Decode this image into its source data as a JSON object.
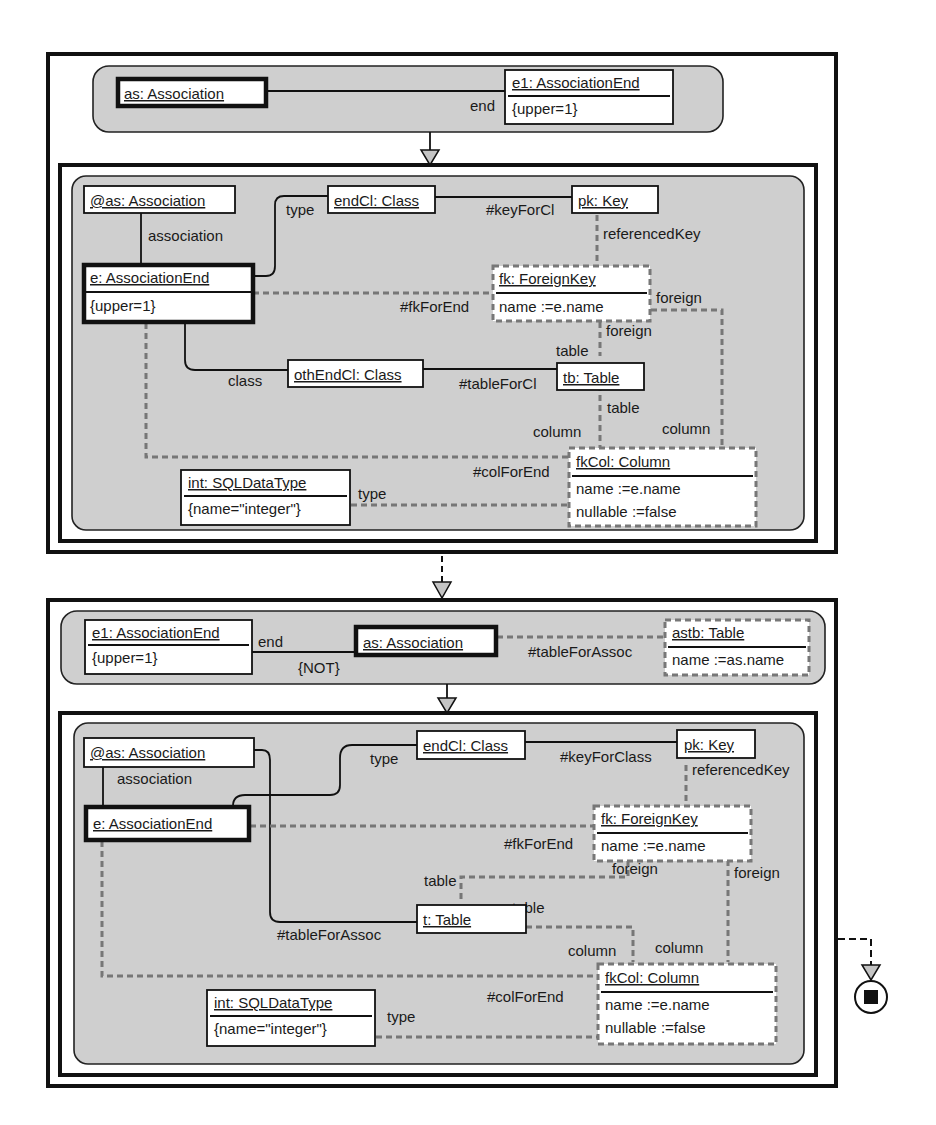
{
  "rule1": {
    "lhs": {
      "as_assoc": "as: Association",
      "e1_end": "e1: AssociationEnd",
      "e1_attr": "{upper=1}",
      "edge_end": "end"
    },
    "rhs": {
      "at_as": "@as: Association",
      "association": "association",
      "e_end": "e: AssociationEnd",
      "e_attr": "{upper=1}",
      "type": "type",
      "endCl": "endCl: Class",
      "keyForCl": "#keyForCl",
      "pk": "pk: Key",
      "referencedKey": "referencedKey",
      "fk": "fk: ForeignKey",
      "fk_attr": "name :=e.name",
      "fkForEnd": "#fkForEnd",
      "foreign1": "foreign",
      "foreign2": "foreign",
      "table1": "table",
      "class": "class",
      "othEndCl": "othEndCl: Class",
      "tableForCl": "#tableForCl",
      "tb": "tb: Table",
      "table2": "table",
      "column1": "column",
      "column2": "column",
      "colForEnd": "#colForEnd",
      "fkCol": "fkCol: Column",
      "fkCol_attr1": "name :=e.name",
      "fkCol_attr2": "nullable :=false",
      "int": "int: SQLDataType",
      "int_attr": "{name=\"integer\"}",
      "type2": "type"
    }
  },
  "rule2": {
    "lhs": {
      "e1_end": "e1: AssociationEnd",
      "e1_attr": "{upper=1}",
      "edge_end": "end",
      "not": "{NOT}",
      "as_assoc": "as: Association",
      "tableForAssoc": "#tableForAssoc",
      "astb": "astb: Table",
      "astb_attr": "name :=as.name"
    },
    "rhs": {
      "at_as": "@as: Association",
      "association": "association",
      "e_end": "e: AssociationEnd",
      "type": "type",
      "endCl": "endCl: Class",
      "keyForClass": "#keyForClass",
      "pk": "pk: Key",
      "referencedKey": "referencedKey",
      "fk": "fk: ForeignKey",
      "fk_attr": "name :=e.name",
      "fkForEnd": "#fkForEnd",
      "foreign1": "foreign",
      "foreign2": "foreign",
      "table1": "table",
      "table2": "table",
      "t": "t: Table",
      "tableForAssoc": "#tableForAssoc",
      "column1": "column",
      "column2": "column",
      "colForEnd": "#colForEnd",
      "fkCol": "fkCol: Column",
      "fkCol_attr1": "name :=e.name",
      "fkCol_attr2": "nullable :=false",
      "int": "int: SQLDataType",
      "int_attr": "{name=\"integer\"}",
      "type2": "type"
    }
  },
  "end_node": "final-state-icon"
}
